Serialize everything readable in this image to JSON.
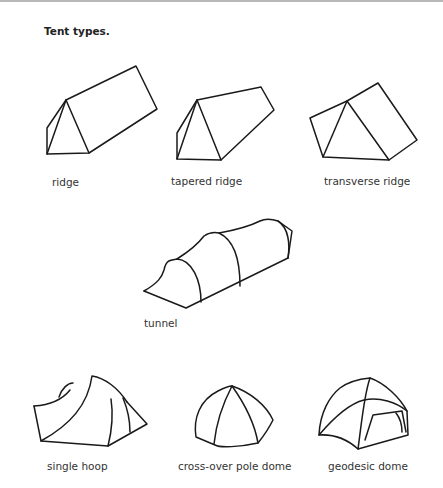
{
  "figure": {
    "title": "Tent types.",
    "tents": [
      {
        "id": "ridge",
        "label": "ridge"
      },
      {
        "id": "tapered-ridge",
        "label": "tapered ridge"
      },
      {
        "id": "transverse-ridge",
        "label": "transverse ridge"
      },
      {
        "id": "tunnel",
        "label": "tunnel"
      },
      {
        "id": "single-hoop",
        "label": "single hoop"
      },
      {
        "id": "cross-over-pole-dome",
        "label": "cross-over pole dome"
      },
      {
        "id": "geodesic-dome",
        "label": "geodesic dome"
      }
    ]
  }
}
